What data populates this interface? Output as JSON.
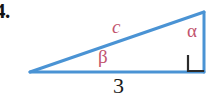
{
  "figure": {
    "problem_number": "4.",
    "background_color": "#ffffff",
    "triangle": {
      "type": "right-triangle",
      "stroke_color": "#4a93d4",
      "stroke_width": 3,
      "vertices": {
        "left": {
          "x": 30,
          "y": 72
        },
        "top_right": {
          "x": 204,
          "y": 12
        },
        "bottom_right": {
          "x": 204,
          "y": 72
        }
      }
    },
    "right_angle_marker": {
      "name": "right-angle",
      "color": "#2b2b2b",
      "x": 188,
      "y": 56,
      "size": 15
    },
    "labels": {
      "hypotenuse": "c",
      "angle_alpha": "α",
      "angle_beta": "β",
      "base_length": "3"
    },
    "colors": {
      "label_pink": "#c2546e",
      "line_blue": "#4a93d4",
      "text_black": "#1a1a1a"
    }
  }
}
